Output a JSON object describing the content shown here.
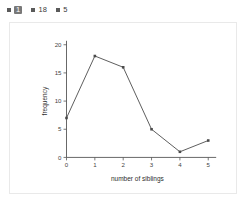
{
  "legend": {
    "items": [
      {
        "label": "1",
        "active": true,
        "swatch_color": "#5a5a5a"
      },
      {
        "label": "18",
        "active": false,
        "swatch_color": "#5a5a5a"
      },
      {
        "label": "5",
        "active": false,
        "swatch_color": "#5a5a5a"
      }
    ]
  },
  "chart_data": {
    "type": "line",
    "title": "",
    "xlabel": "number of siblings",
    "ylabel": "frequency",
    "x": [
      0,
      1,
      2,
      3,
      4,
      5
    ],
    "values": [
      7,
      18,
      16,
      5,
      1,
      3
    ],
    "categories": [
      "0",
      "1",
      "2",
      "3",
      "4",
      "5"
    ],
    "xticks": [
      "0",
      "1",
      "2",
      "3",
      "4",
      "5"
    ],
    "yticks": [
      "0",
      "5",
      "10",
      "15",
      "20"
    ],
    "ytick_values": [
      0,
      5,
      10,
      15,
      20
    ],
    "xlim": [
      0,
      5
    ],
    "ylim": [
      0,
      20
    ],
    "grid": false,
    "legend_position": "none",
    "line_color": "#4a4a4a",
    "marker": "square"
  },
  "colors": {
    "panel_border": "#e9e9e9",
    "axis": "#555555",
    "badge_bg": "#787878",
    "text": "#333333"
  }
}
